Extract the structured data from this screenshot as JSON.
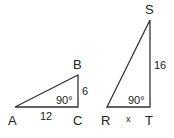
{
  "triangles": [
    {
      "name": "ABC",
      "vertices": {
        "A": "A",
        "B": "B",
        "C": "C"
      },
      "right_angle": "90°",
      "sides": {
        "AC": "12",
        "BC": "6"
      }
    },
    {
      "name": "RST",
      "vertices": {
        "R": "R",
        "S": "S",
        "T": "T"
      },
      "right_angle": "90°",
      "sides": {
        "RT": "x",
        "ST": "16"
      }
    }
  ],
  "colors": {
    "line": "#333333",
    "text": "#222222"
  }
}
